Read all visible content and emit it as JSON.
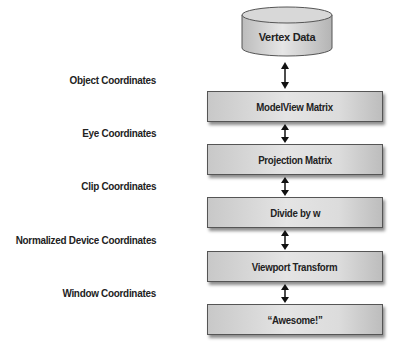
{
  "diagram": {
    "source": {
      "label": "Vertex Data",
      "shape": "cylinder"
    },
    "stages": [
      {
        "label": "ModelView Matrix"
      },
      {
        "label": "Projection Matrix"
      },
      {
        "label": "Divide by w"
      },
      {
        "label": "Viewport Transform"
      },
      {
        "label": "“Awesome!”"
      }
    ],
    "coordinate_spaces": [
      {
        "label": "Object Coordinates"
      },
      {
        "label": "Eye Coordinates"
      },
      {
        "label": "Clip Coordinates"
      },
      {
        "label": "Normalized Device Coordinates"
      },
      {
        "label": "Window Coordinates"
      }
    ],
    "connector": "double-headed-arrow",
    "colors": {
      "box_fill": "#dcdcdc",
      "box_border": "#555555",
      "text": "#222222"
    }
  }
}
